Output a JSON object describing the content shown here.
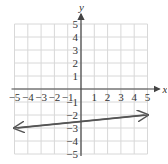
{
  "chart_data": {
    "type": "line",
    "title": "",
    "xlabel": "x",
    "ylabel": "y",
    "xlim": [
      -5,
      5
    ],
    "ylim": [
      -5,
      5
    ],
    "grid": true,
    "x_ticks": [
      "-5",
      "-4",
      "-3",
      "-2",
      "-1",
      "1",
      "2",
      "3",
      "4",
      "5"
    ],
    "y_ticks": [
      "5",
      "4",
      "3",
      "2",
      "1",
      "-1",
      "-2",
      "-3",
      "-4",
      "-5"
    ],
    "series": [
      {
        "name": "line",
        "equation": "y = 0.1x - 2.5",
        "x": [
          -5,
          5
        ],
        "y": [
          -3,
          -2
        ],
        "arrows": "both",
        "color": "#555555"
      }
    ]
  },
  "labels": {
    "x_axis": "x",
    "y_axis": "y"
  }
}
